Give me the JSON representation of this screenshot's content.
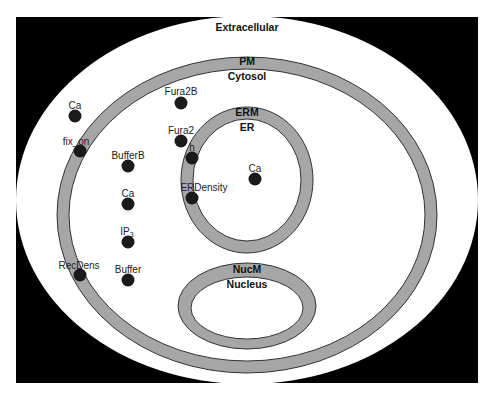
{
  "diagram": {
    "colors": {
      "background": "#000000",
      "compartment_fill": "#ffffff",
      "membrane_fill": "#a6a6a6",
      "membrane_stroke": "#333333",
      "species_fill": "#1a1a1a"
    },
    "compartments": [
      {
        "id": "extracellular",
        "label": "Extracellular"
      },
      {
        "id": "pm",
        "label": "PM"
      },
      {
        "id": "cytosol",
        "label": "Cytosol"
      },
      {
        "id": "erm",
        "label": "ERM"
      },
      {
        "id": "er",
        "label": "ER"
      },
      {
        "id": "nucm",
        "label": "NucM"
      },
      {
        "id": "nucleus",
        "label": "Nucleus"
      }
    ],
    "species": [
      {
        "label": "Ca",
        "compartment": "Extracellular"
      },
      {
        "label": "fix_on",
        "compartment": "PM"
      },
      {
        "label": "RecDens",
        "compartment": "PM"
      },
      {
        "label": "Fura2B",
        "compartment": "Cytosol"
      },
      {
        "label": "Fura2",
        "compartment": "Cytosol"
      },
      {
        "label": "BufferB",
        "compartment": "Cytosol"
      },
      {
        "label": "Ca",
        "compartment": "Cytosol"
      },
      {
        "label": "IP",
        "sub": "3",
        "compartment": "Cytosol"
      },
      {
        "label": "Buffer",
        "compartment": "Cytosol"
      },
      {
        "label": "h",
        "compartment": "ERM"
      },
      {
        "label": "ERDensity",
        "compartment": "ERM"
      },
      {
        "label": "Ca",
        "compartment": "ER"
      }
    ]
  }
}
